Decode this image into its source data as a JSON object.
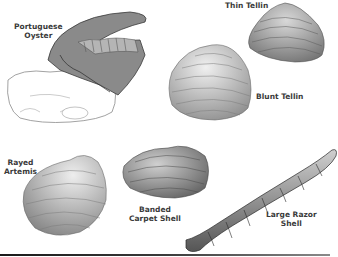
{
  "illustration": {
    "subject": "Seashell species illustration",
    "labels": {
      "portuguese_oyster": {
        "line1": "Portuguese",
        "line2": "Oyster"
      },
      "thin_tellin": {
        "line1": "Thin Tellin"
      },
      "blunt_tellin": {
        "line1": "Blunt Tellin"
      },
      "rayed_artemis": {
        "line1": "Rayed",
        "line2": "Artemis"
      },
      "banded_carpet_shell": {
        "line1": "Banded",
        "line2": "Carpet Shell"
      },
      "large_razor_shell": {
        "line1": "Large Razor",
        "line2": "Shell"
      }
    },
    "colors": {
      "background": "#ffffff",
      "ink": "#3a3a3a",
      "shell_shade": "#9a9a9a",
      "rule": "#1a1a1a"
    }
  }
}
